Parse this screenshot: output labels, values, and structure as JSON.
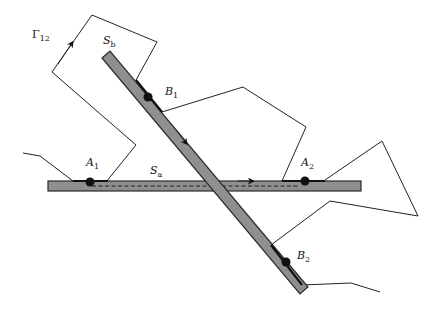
{
  "labels": {
    "gamma": "Γ",
    "gamma_sub": "12",
    "sb": "S",
    "sb_sub": "b",
    "sa": "S",
    "sa_sub": "a",
    "b1": "B",
    "b1_sub": "1",
    "b2": "B",
    "b2_sub": "2",
    "a1": "A",
    "a1_sub": "1",
    "a2": "A",
    "a2_sub": "2"
  },
  "colors": {
    "bar_fill": "#8f8f8f",
    "line": "#222222",
    "point": "#111111"
  },
  "elements": {
    "bars": [
      {
        "name": "S_a",
        "orientation": "horizontal",
        "from": [
          48,
          186
        ],
        "to": [
          361,
          186
        ]
      },
      {
        "name": "S_b",
        "orientation": "diagonal",
        "from": [
          106,
          55
        ],
        "to": [
          302,
          290
        ]
      }
    ],
    "points": [
      {
        "name": "A1",
        "x": 90,
        "y": 182
      },
      {
        "name": "A2",
        "x": 305,
        "y": 181
      },
      {
        "name": "B1",
        "x": 148,
        "y": 97
      },
      {
        "name": "B2",
        "x": 286,
        "y": 262
      }
    ],
    "curve": "Γ12 — closed polygonal path crossing S_a and S_b, with arrows indicating orientation"
  }
}
